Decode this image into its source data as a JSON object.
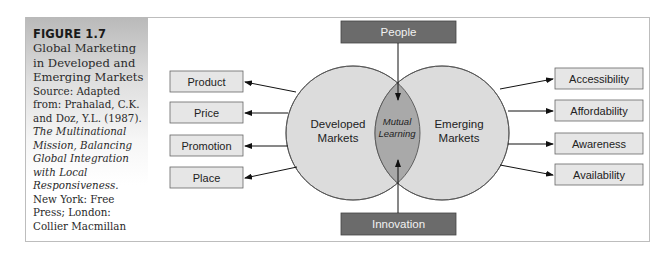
{
  "caption": {
    "figure_number": "FIGURE 1.7",
    "title": "Global Marketing in Developed and Emerging Markets",
    "source_prefix": "Source: Adapted from: Prahalad, C.K. and Doz, Y.L. (1987).",
    "source_book": "The Multinational Mission, Balancing Global Integration with Local Responsiveness.",
    "source_publisher": "New York: Free Press; London: Collier Macmillan"
  },
  "diagram": {
    "top_box": "People",
    "bottom_box": "Innovation",
    "left_circle": [
      "Developed",
      "Markets"
    ],
    "right_circle": [
      "Emerging",
      "Markets"
    ],
    "overlap": [
      "Mutual",
      "Learning"
    ],
    "left_boxes": [
      "Product",
      "Price",
      "Promotion",
      "Place"
    ],
    "right_boxes": [
      "Accessibility",
      "Affordability",
      "Awareness",
      "Availability"
    ]
  },
  "colors": {
    "circle_fill": "#dcdcdc",
    "overlap_fill": "#a9a9a9",
    "dark_box": "#6b6b6b",
    "light_box": "#e6e6e6"
  }
}
